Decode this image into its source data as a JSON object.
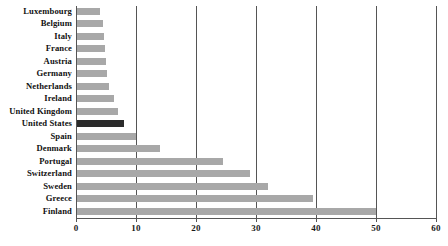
{
  "chart_data": {
    "type": "bar",
    "orientation": "horizontal",
    "title": "",
    "subtitle": "",
    "xlabel": "",
    "ylabel": "",
    "xlim": [
      0,
      60
    ],
    "ylim": null,
    "grid": true,
    "legend": null,
    "xticks": [
      0,
      10,
      20,
      30,
      40,
      50,
      60
    ],
    "xtick_labels": [
      "0",
      "10",
      "20",
      "30",
      "40",
      "50",
      "60"
    ],
    "categories": [
      "Luxembourg",
      "Belgium",
      "Italy",
      "France",
      "Austria",
      "Germany",
      "Netherlands",
      "Ireland",
      "United Kingdom",
      "United States",
      "Spain",
      "Denmark",
      "Portugal",
      "Switzerland",
      "Sweden",
      "Greece",
      "Finland"
    ],
    "values": [
      4,
      4.5,
      4.7,
      4.8,
      5,
      5.2,
      5.5,
      6.3,
      7,
      8,
      10,
      14,
      24.5,
      29,
      32,
      39.5,
      50
    ],
    "highlight_category": "United States",
    "colors": {
      "bar": "#a8a8a8",
      "bar_highlight": "#2b2b2b",
      "axis": "#555555",
      "grid": "#555555",
      "text": "#111111",
      "background": "#ffffff"
    }
  }
}
